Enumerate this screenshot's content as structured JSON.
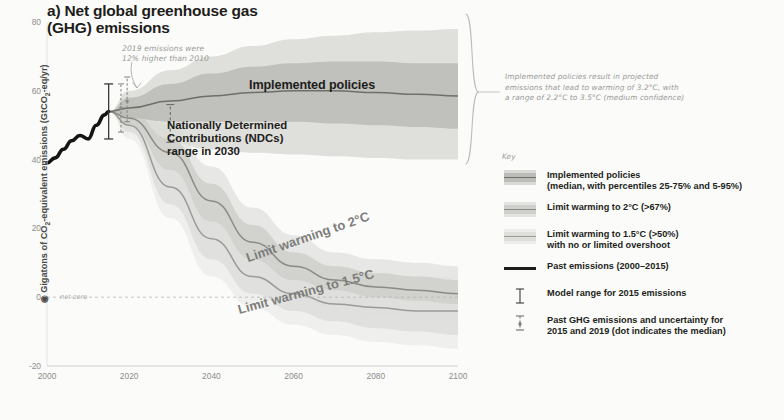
{
  "figure": {
    "panel_label": "a)",
    "title": "Net global greenhouse gas (GHG) emissions",
    "y_axis_title": "Gigatons of CO2-equivalent emissions (GtCO2-eq/yr)",
    "y_axis_title_prefix": "Gigatons of CO",
    "y_axis_title_mid": "-equivalent emissions (GtCO",
    "y_axis_title_suffix": "-eq/yr)",
    "net_zero_label": "net zero"
  },
  "annotations": {
    "emissions_2019": "2019 emissions were\n12% higher than 2010",
    "emissions_2019_line1": "2019 emissions were",
    "emissions_2019_line2": "12% higher than 2010",
    "side_note_line1": "Implemented policies result in projected",
    "side_note_line2": "emissions that lead to warming of 3.2°C, with",
    "side_note_line3": "a range of 2.2°C to 3.5°C (medium confidence)"
  },
  "curve_labels": {
    "implemented": "Implemented policies",
    "ndc_line1": "Nationally Determined",
    "ndc_line2": "Contributions (NDCs)",
    "ndc_line3": "range in 2030",
    "limit_2c": "Limit warming to 2°C",
    "limit_15c": "Limit warming to 1.5°C"
  },
  "key": {
    "title": "Key",
    "items": [
      {
        "id": "implemented-policies",
        "mark": "band",
        "line1": "Implemented policies",
        "line2": "(median, with percentiles 25-75% and 5-95%)",
        "color_outer": "#d9d9d6",
        "color_inner": "#bcbcb8",
        "color_median": "#6e6e6a"
      },
      {
        "id": "limit-2c",
        "mark": "band",
        "line1": "Limit warming to 2°C (>67%)",
        "line2": "",
        "color_outer": "#e3e3e0",
        "color_inner": "#cfcfcb",
        "color_median": "#8a8a86"
      },
      {
        "id": "limit-15c",
        "mark": "band",
        "line1": "Limit warming to 1.5°C (>50%)",
        "line2": "with no or limited overshoot",
        "color_outer": "#ececea",
        "color_inner": "#dedeDB",
        "color_median": "#9a9a96"
      },
      {
        "id": "past-emissions",
        "mark": "line",
        "line1": "Past emissions (2000–2015)",
        "line2": "",
        "color_outer": "#1d1d1b",
        "color_inner": "#1d1d1b",
        "color_median": "#1d1d1b"
      },
      {
        "id": "model-range-2015",
        "mark": "ibar",
        "line1": "Model range for 2015 emissions",
        "line2": "",
        "color_outer": "#4a4a48",
        "color_inner": "#4a4a48",
        "color_median": "#4a4a48"
      },
      {
        "id": "past-ghg-uncertainty",
        "mark": "dashbar",
        "line1": "Past GHG emissions and uncertainty for",
        "line2": "2015 and 2019 (dot indicates the median)",
        "color_outer": "#7a7a77",
        "color_inner": "#7a7a77",
        "color_median": "#7a7a77"
      }
    ]
  },
  "chart_data": {
    "type": "area",
    "title": "Net global greenhouse gas (GHG) emissions",
    "xlabel": "",
    "ylabel": "Gigatons of CO2-equivalent emissions (GtCO2-eq/yr)",
    "xlim": [
      2000,
      2100
    ],
    "ylim": [
      -20,
      80
    ],
    "xticks": [
      2000,
      2020,
      2040,
      2060,
      2080,
      2100
    ],
    "yticks": [
      80,
      60,
      40,
      20,
      0,
      -20
    ],
    "grid": false,
    "legend": "right",
    "zero_line": 0,
    "past_emissions": {
      "name": "Past emissions (2000–2015)",
      "color": "#141412",
      "x": [
        2000,
        2002,
        2004,
        2006,
        2008,
        2010,
        2012,
        2014,
        2015
      ],
      "y": [
        39,
        40.5,
        43,
        45.5,
        47,
        46,
        50,
        53,
        54
      ]
    },
    "series": [
      {
        "name": "Implemented policies",
        "color_median": "#6e6e6a",
        "color_p25_75": "#bcbcb8",
        "color_p5_95": "#d9d9d6",
        "x": [
          2015,
          2020,
          2030,
          2040,
          2050,
          2060,
          2070,
          2080,
          2090,
          2100
        ],
        "median": [
          54,
          55,
          57,
          58.5,
          59.5,
          60,
          60,
          59.5,
          59,
          58.5
        ],
        "p25": [
          54,
          52,
          51,
          51,
          51,
          51,
          50.5,
          50,
          49.5,
          49
        ],
        "p75": [
          54,
          58,
          62,
          65,
          67,
          68,
          68.5,
          68.5,
          68,
          68
        ],
        "p5": [
          54,
          49,
          45,
          43,
          42,
          41.5,
          41,
          40.5,
          40,
          40
        ],
        "p95": [
          54,
          60,
          66,
          70,
          73,
          75,
          76,
          77,
          77.5,
          78
        ]
      },
      {
        "name": "Limit warming to 2°C (>67%)",
        "color_median": "#8a8a86",
        "color_p25_75": "#cfcfcb",
        "color_p5_95": "#e3e3e0",
        "x": [
          2015,
          2020,
          2030,
          2040,
          2050,
          2060,
          2070,
          2080,
          2090,
          2100
        ],
        "median": [
          54,
          52,
          42,
          28,
          16,
          9,
          5,
          3,
          2,
          1
        ],
        "p25": [
          54,
          50,
          37,
          22,
          11,
          5,
          2,
          0,
          -1,
          -2
        ],
        "p75": [
          54,
          54,
          46,
          33,
          21,
          13,
          9,
          7,
          6,
          5
        ],
        "p5": [
          54,
          48,
          33,
          17,
          6,
          0,
          -3,
          -5,
          -6,
          -7
        ],
        "p95": [
          54,
          56,
          50,
          38,
          26,
          18,
          13,
          11,
          10,
          9
        ]
      },
      {
        "name": "Limit warming to 1.5°C (>50%) with no or limited overshoot",
        "color_median": "#9a9a96",
        "color_p25_75": "#dededb",
        "color_p5_95": "#ececea",
        "x": [
          2015,
          2020,
          2030,
          2040,
          2050,
          2060,
          2070,
          2080,
          2090,
          2100
        ],
        "median": [
          54,
          50,
          32,
          17,
          6,
          1,
          -2,
          -3,
          -4,
          -4
        ],
        "p25": [
          54,
          48,
          27,
          11,
          1,
          -4,
          -7,
          -9,
          -10,
          -11
        ],
        "p75": [
          54,
          52,
          37,
          22,
          11,
          6,
          3,
          2,
          1,
          1
        ],
        "p5": [
          54,
          46,
          23,
          6,
          -3,
          -8,
          -11,
          -13,
          -14,
          -15
        ],
        "p95": [
          54,
          54,
          41,
          27,
          16,
          11,
          8,
          7,
          6,
          6
        ]
      }
    ],
    "markers": {
      "model_range_2015": {
        "x": 2015,
        "low": 46,
        "high": 62,
        "median": 54
      },
      "past_ghg_2015": {
        "x": 2018,
        "low": 48,
        "high": 62,
        "median": 55
      },
      "past_ghg_2019": {
        "x": 2019.5,
        "low": 51,
        "high": 64,
        "median": 57
      },
      "ndc_range_2030": {
        "x": 2030,
        "low": 45,
        "high": 56
      }
    },
    "annotations": [
      {
        "id": "emissions-2019",
        "text": "2019 emissions were 12% higher than 2010",
        "x": 2020,
        "y": 72
      },
      {
        "id": "net-zero",
        "text": "net zero",
        "x": 2004,
        "y": 0
      }
    ]
  }
}
